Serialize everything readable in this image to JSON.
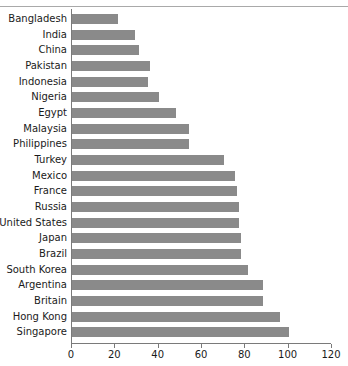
{
  "chart_data": {
    "type": "bar",
    "orientation": "horizontal",
    "title": "",
    "subtitle": "",
    "xlabel": "",
    "ylabel": "",
    "xlim": [
      0,
      120
    ],
    "xticks": [
      0,
      20,
      40,
      60,
      80,
      100,
      120
    ],
    "xtick_labels": [
      "0",
      "20",
      "40",
      "60",
      "80",
      "100",
      "120"
    ],
    "grid": false,
    "legend": false,
    "bar_color": "#8a8a8a",
    "axis_color": "#7a7a7a",
    "categories": [
      "Bangladesh",
      "India",
      "China",
      "Pakistan",
      "Indonesia",
      "Nigeria",
      "Egypt",
      "Malaysia",
      "Philippines",
      "Turkey",
      "Mexico",
      "France",
      "Russia",
      "United States",
      "Japan",
      "Brazil",
      "South Korea",
      "Argentina",
      "Britain",
      "Hong Kong",
      "Singapore"
    ],
    "values": [
      21,
      29,
      31,
      36,
      35,
      40,
      48,
      54,
      54,
      70,
      75,
      76,
      77,
      77,
      78,
      78,
      81,
      88,
      88,
      96,
      100
    ]
  }
}
